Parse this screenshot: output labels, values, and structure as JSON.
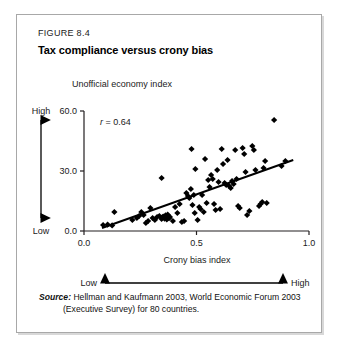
{
  "figure": {
    "number": "FIGURE 8.4",
    "title": "Tax compliance versus crony bias"
  },
  "source": {
    "label": "Source:",
    "line1": "Hellman and Kaufmann 2003, World Economic Forum 2003",
    "line2": "(Executive Survey) for 80 countries."
  },
  "axis_qualifiers": {
    "y_high": "High",
    "y_low": "Low",
    "x_low": "Low",
    "x_high": "High"
  },
  "chart_data": {
    "type": "scatter",
    "title": "Tax compliance versus crony bias",
    "xlabel": "Crony bias index",
    "ylabel": "Unofficial economy index",
    "xlim": [
      0.0,
      1.0
    ],
    "ylim": [
      0.0,
      60.0
    ],
    "xticks": [
      "0.0",
      "0.5",
      "1.0"
    ],
    "xtick_values": [
      0.0,
      0.5,
      1.0
    ],
    "yticks": [
      "0.0",
      "30.0",
      "60.0"
    ],
    "ytick_values": [
      0.0,
      30.0,
      60.0
    ],
    "grid": false,
    "legend": "none",
    "annotation": {
      "text": "r = 0.64",
      "symbol": "r",
      "equals": " = ",
      "value": "0.64",
      "x": 0.09,
      "y": 56.0
    },
    "trendline": {
      "label": "linear fit",
      "x": [
        0.08,
        0.93
      ],
      "y": [
        1.5,
        35.5
      ]
    },
    "marker": "diamond",
    "marker_color": "#000000",
    "n_points": 80,
    "points": [
      [
        0.085,
        3.0
      ],
      [
        0.105,
        3.2
      ],
      [
        0.125,
        2.8
      ],
      [
        0.135,
        9.5
      ],
      [
        0.215,
        5.5
      ],
      [
        0.235,
        6.5
      ],
      [
        0.245,
        7.5
      ],
      [
        0.255,
        9.5
      ],
      [
        0.265,
        8.0
      ],
      [
        0.275,
        4.0
      ],
      [
        0.285,
        5.0
      ],
      [
        0.295,
        11.5
      ],
      [
        0.305,
        6.5
      ],
      [
        0.315,
        5.5
      ],
      [
        0.325,
        7.0
      ],
      [
        0.335,
        7.5
      ],
      [
        0.345,
        6.0
      ],
      [
        0.348,
        6.8
      ],
      [
        0.352,
        7.2
      ],
      [
        0.358,
        6.2
      ],
      [
        0.362,
        7.8
      ],
      [
        0.368,
        5.8
      ],
      [
        0.372,
        8.2
      ],
      [
        0.378,
        6.4
      ],
      [
        0.382,
        7.0
      ],
      [
        0.345,
        26.5
      ],
      [
        0.395,
        5.0
      ],
      [
        0.405,
        12.0
      ],
      [
        0.415,
        9.0
      ],
      [
        0.425,
        13.5
      ],
      [
        0.435,
        4.5
      ],
      [
        0.445,
        5.0
      ],
      [
        0.455,
        19.0
      ],
      [
        0.462,
        17.5
      ],
      [
        0.468,
        16.5
      ],
      [
        0.475,
        21.0
      ],
      [
        0.478,
        41.0
      ],
      [
        0.482,
        13.0
      ],
      [
        0.488,
        18.0
      ],
      [
        0.492,
        9.0
      ],
      [
        0.495,
        31.0
      ],
      [
        0.505,
        5.5
      ],
      [
        0.512,
        12.0
      ],
      [
        0.518,
        11.0
      ],
      [
        0.525,
        18.0
      ],
      [
        0.532,
        9.5
      ],
      [
        0.538,
        36.0
      ],
      [
        0.545,
        14.0
      ],
      [
        0.552,
        25.5
      ],
      [
        0.558,
        22.0
      ],
      [
        0.565,
        28.0
      ],
      [
        0.572,
        26.0
      ],
      [
        0.578,
        13.5
      ],
      [
        0.585,
        10.5
      ],
      [
        0.592,
        30.5
      ],
      [
        0.598,
        24.5
      ],
      [
        0.605,
        11.0
      ],
      [
        0.612,
        41.0
      ],
      [
        0.618,
        33.5
      ],
      [
        0.625,
        24.0
      ],
      [
        0.632,
        23.0
      ],
      [
        0.638,
        35.5
      ],
      [
        0.645,
        22.5
      ],
      [
        0.652,
        21.5
      ],
      [
        0.658,
        25.0
      ],
      [
        0.665,
        23.5
      ],
      [
        0.672,
        40.5
      ],
      [
        0.678,
        26.0
      ],
      [
        0.685,
        12.5
      ],
      [
        0.692,
        11.5
      ],
      [
        0.705,
        41.5
      ],
      [
        0.712,
        38.5
      ],
      [
        0.718,
        29.5
      ],
      [
        0.725,
        8.0
      ],
      [
        0.735,
        10.0
      ],
      [
        0.748,
        42.5
      ],
      [
        0.755,
        40.5
      ],
      [
        0.762,
        30.5
      ],
      [
        0.778,
        12.5
      ],
      [
        0.785,
        13.5
      ],
      [
        0.792,
        14.5
      ],
      [
        0.798,
        31.5
      ],
      [
        0.805,
        35.0
      ],
      [
        0.812,
        14.0
      ],
      [
        0.845,
        55.5
      ],
      [
        0.878,
        32.5
      ],
      [
        0.895,
        35.0
      ]
    ]
  }
}
